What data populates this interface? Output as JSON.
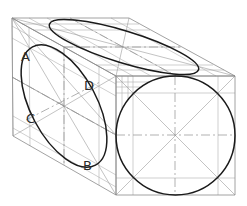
{
  "figure": {
    "labels": [
      {
        "id": "A",
        "text": "A",
        "x": 21,
        "y": 61
      },
      {
        "id": "D",
        "text": "D",
        "x": 84,
        "y": 90
      },
      {
        "id": "C",
        "text": "C",
        "x": 26,
        "y": 123
      },
      {
        "id": "B",
        "text": "B",
        "x": 83,
        "y": 170
      }
    ],
    "colors": {
      "curve": "#1a1a1a",
      "construction": "#8a8a8a",
      "background": "#ffffff"
    }
  }
}
